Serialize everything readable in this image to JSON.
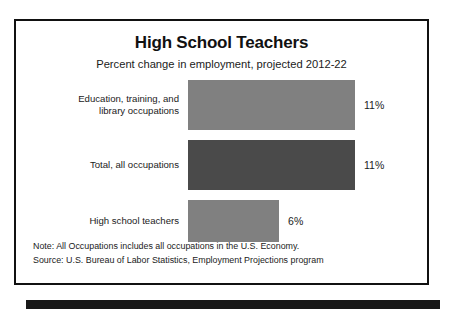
{
  "chart_data": {
    "type": "bar",
    "orientation": "horizontal",
    "title": "High School Teachers",
    "subtitle": "Percent change in employment, projected 2012-22",
    "xlabel": "",
    "ylabel": "",
    "xlim": [
      0,
      11
    ],
    "grid": false,
    "legend": "none",
    "categories": [
      "Education, training, and library occupations",
      "Total, all occupations",
      "High school teachers"
    ],
    "values": [
      11,
      11,
      6
    ],
    "value_labels": [
      "11%",
      "11%",
      "6%"
    ],
    "bar_colors": [
      "#808080",
      "#4a4a4a",
      "#808080"
    ],
    "bars": [
      {
        "label_line1": "Education, training, and",
        "label_line2": "library occupations",
        "value": 11,
        "value_label": "11%",
        "color": "#808080"
      },
      {
        "label_line1": "Total, all occupations",
        "label_line2": "",
        "value": 11,
        "value_label": "11%",
        "color": "#4a4a4a"
      },
      {
        "label_line1": "High school teachers",
        "label_line2": "",
        "value": 6,
        "value_label": "6%",
        "color": "#808080"
      }
    ],
    "notes": [
      "Note: All Occupations includes all occupations in the U.S. Economy.",
      "Source: U.S. Bureau of Labor Statistics, Employment Projections program"
    ]
  },
  "colors": {
    "border": "#111111",
    "text": "#1b1b1b",
    "bar_light": "#808080",
    "bar_dark": "#4a4a4a",
    "strip": "#181818",
    "background": "#ffffff"
  }
}
